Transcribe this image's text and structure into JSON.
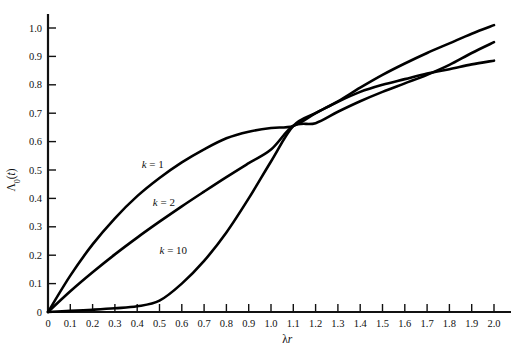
{
  "chart_data": {
    "type": "line",
    "title": "",
    "xlabel": "λr",
    "ylabel": "Λ₀(t)",
    "xlim": [
      0,
      2.0
    ],
    "ylim": [
      0,
      1.05
    ],
    "grid": false,
    "legend_position": "inline-curve-labels",
    "xticks": [
      "0",
      "0.1",
      "0.2",
      "0.3",
      "0.4",
      "0.5",
      "0.6",
      "0.7",
      "0.8",
      "0.9",
      "1.0",
      "1.1",
      "1.2",
      "1.3",
      "1.4",
      "1.5",
      "1.6",
      "1.7",
      "1.8",
      "1.9",
      "2.0"
    ],
    "xtick_values": [
      0,
      0.1,
      0.2,
      0.3,
      0.4,
      0.5,
      0.6,
      0.7,
      0.8,
      0.9,
      1.0,
      1.1,
      1.2,
      1.3,
      1.4,
      1.5,
      1.6,
      1.7,
      1.8,
      1.9,
      2.0
    ],
    "yticks": [
      "0",
      "0.1",
      "0.2",
      "0.3",
      "0.4",
      "0.5",
      "0.6",
      "0.7",
      "0.8",
      "0.9",
      "1.0"
    ],
    "ytick_values": [
      0,
      0.1,
      0.2,
      0.3,
      0.4,
      0.5,
      0.6,
      0.7,
      0.8,
      0.9,
      1.0
    ],
    "crossing_point": {
      "x": 1.1,
      "y": 0.655
    },
    "x": [
      0,
      0.1,
      0.2,
      0.3,
      0.4,
      0.5,
      0.6,
      0.7,
      0.8,
      0.9,
      1.0,
      1.1,
      1.2,
      1.3,
      1.4,
      1.5,
      1.6,
      1.7,
      1.8,
      1.9,
      2.0
    ],
    "series": [
      {
        "name": "k = 1",
        "label": "k = 1",
        "k": 1,
        "color": "#000000",
        "label_x": 0.42,
        "label_y": 0.508,
        "values": [
          0.0,
          0.095,
          0.181,
          0.259,
          0.33,
          0.393,
          0.451,
          0.503,
          0.551,
          0.593,
          0.632,
          0.667,
          0.699,
          0.727,
          0.753,
          0.777,
          0.798,
          0.817,
          0.835,
          0.85,
          0.865
        ]
      },
      {
        "name": "k = 2",
        "label": "k = 2",
        "k": 2,
        "color": "#000000",
        "label_x": 0.47,
        "label_y": 0.375,
        "values": [
          0.0,
          0.0047,
          0.0175,
          0.0369,
          0.0616,
          0.0902,
          0.1219,
          0.1558,
          0.1912,
          0.2275,
          0.2642,
          0.301,
          0.3374,
          0.3732,
          0.4082,
          0.4422,
          0.4751,
          0.5068,
          0.5372,
          0.5663,
          0.594
        ]
      },
      {
        "name": "k = 10",
        "label": "k = 10",
        "k": 10,
        "color": "#000000",
        "label_x": 0.5,
        "label_y": 0.205,
        "values": [
          0.0,
          0.0,
          0.0,
          0.0,
          0.0001,
          0.0009,
          0.005,
          0.018,
          0.047,
          0.098,
          0.173,
          0.266,
          0.368,
          0.467,
          0.557,
          0.634,
          0.697,
          0.748,
          0.788,
          0.82,
          0.845
        ]
      }
    ],
    "rendered_series": [
      {
        "name": "k = 1",
        "values": [
          0.0,
          0.128,
          0.238,
          0.33,
          0.408,
          0.472,
          0.527,
          0.573,
          0.612,
          0.635,
          0.648,
          0.655,
          0.7,
          0.742,
          0.79,
          0.835,
          0.875,
          0.912,
          0.946,
          0.98,
          1.01
        ]
      },
      {
        "name": "k = 2",
        "values": [
          0.0,
          0.073,
          0.14,
          0.203,
          0.262,
          0.318,
          0.372,
          0.424,
          0.475,
          0.524,
          0.572,
          0.655,
          0.665,
          0.705,
          0.742,
          0.775,
          0.805,
          0.835,
          0.87,
          0.912,
          0.95
        ]
      },
      {
        "name": "k = 10",
        "values": [
          0.0,
          0.004,
          0.008,
          0.013,
          0.02,
          0.04,
          0.1,
          0.18,
          0.28,
          0.4,
          0.53,
          0.655,
          0.7,
          0.74,
          0.775,
          0.8,
          0.82,
          0.84,
          0.855,
          0.872,
          0.885
        ]
      }
    ]
  },
  "axes": {
    "x_axis_name": "lambda-r-axis",
    "y_axis_name": "lambda-zero-t-axis"
  }
}
